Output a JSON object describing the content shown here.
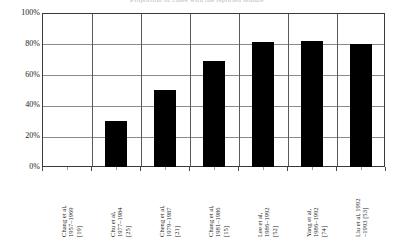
{
  "chart_data": {
    "type": "bar",
    "title": "Proportion of cases with the reported feature",
    "categories": [
      "Chang et al,\n1957–1969\n[19]",
      "Chu et al,\n1977–1984\n[25]",
      "Cheng et al,\n1979–1987\n[21]",
      "Chang et al,\n1981–1986\n[15]",
      "Lee et al,\n1986–1992\n[52]",
      "Yang et al,\n1986–1992\n[74]",
      "Liu et al, 1992\n–1993 [53]"
    ],
    "values": [
      0,
      30,
      50,
      69,
      81,
      82,
      80
    ],
    "xlabel": "",
    "ylabel": "",
    "ylim": [
      0,
      100
    ],
    "yticks": [
      0,
      20,
      40,
      60,
      80,
      100
    ],
    "ytick_labels": [
      "0%",
      "20%",
      "40%",
      "60%",
      "80%",
      "100%"
    ],
    "grid": true,
    "legend": "none",
    "bar_color": "#000000",
    "axis_color": "#3a3a3a",
    "grid_color": "#8a8a8a",
    "background": "#ffffff"
  }
}
